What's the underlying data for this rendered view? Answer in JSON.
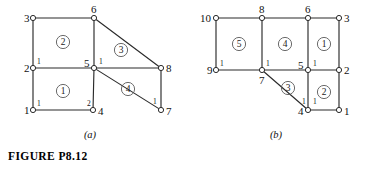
{
  "figure": {
    "caption": "FIGURE  P8.12",
    "sub_caption_a": "(a)",
    "sub_caption_b": "(b)"
  },
  "panel_a": {
    "name": "finite-element-mesh-a",
    "global_nodes": [
      {
        "id": "n1",
        "label": "1",
        "x": 33,
        "y": 110,
        "label_dx": -9,
        "label_dy": 4
      },
      {
        "id": "n2",
        "label": "2",
        "x": 33,
        "y": 68,
        "label_dx": -9,
        "label_dy": 4
      },
      {
        "id": "n3",
        "label": "3",
        "x": 33,
        "y": 18,
        "label_dx": -9,
        "label_dy": 4
      },
      {
        "id": "n4",
        "label": "4",
        "x": 93,
        "y": 110,
        "label_dx": 5,
        "label_dy": 5
      },
      {
        "id": "n5",
        "label": "5",
        "x": 94,
        "y": 68,
        "label_dx": -10,
        "label_dy": -1
      },
      {
        "id": "n6",
        "label": "6",
        "x": 94,
        "y": 18,
        "label_dx": -3,
        "label_dy": -5
      },
      {
        "id": "n7",
        "label": "7",
        "x": 161,
        "y": 110,
        "label_dx": 5,
        "label_dy": 5
      },
      {
        "id": "n8",
        "label": "8",
        "x": 161,
        "y": 68,
        "label_dx": 5,
        "label_dy": 4
      }
    ],
    "edges": [
      {
        "from": "n1",
        "to": "n2"
      },
      {
        "from": "n2",
        "to": "n3"
      },
      {
        "from": "n3",
        "to": "n6"
      },
      {
        "from": "n6",
        "to": "n5"
      },
      {
        "from": "n5",
        "to": "n2"
      },
      {
        "from": "n1",
        "to": "n4"
      },
      {
        "from": "n4",
        "to": "n5"
      },
      {
        "from": "n5",
        "to": "n8"
      },
      {
        "from": "n6",
        "to": "n8"
      },
      {
        "from": "n5",
        "to": "n7"
      },
      {
        "from": "n7",
        "to": "n8"
      }
    ],
    "elements": [
      {
        "label": "1",
        "x": 63,
        "y": 91
      },
      {
        "label": "2",
        "x": 63,
        "y": 42
      },
      {
        "label": "3",
        "x": 121,
        "y": 50
      },
      {
        "label": "4",
        "x": 128,
        "y": 89
      }
    ],
    "local_node_labels": [
      {
        "label": "1",
        "x": 37,
        "y": 106
      },
      {
        "label": "1",
        "x": 37,
        "y": 64
      },
      {
        "label": "1",
        "x": 99,
        "y": 64
      },
      {
        "label": "2",
        "x": 87,
        "y": 106
      },
      {
        "label": "1",
        "x": 153,
        "y": 104
      }
    ]
  },
  "panel_b": {
    "name": "finite-element-mesh-b",
    "global_nodes": [
      {
        "id": "m10",
        "label": "10",
        "x": 216,
        "y": 18,
        "label_dx": -16,
        "label_dy": 4
      },
      {
        "id": "m8",
        "label": "8",
        "x": 262,
        "y": 18,
        "label_dx": -3,
        "label_dy": -5
      },
      {
        "id": "m6",
        "label": "6",
        "x": 308,
        "y": 18,
        "label_dx": -3,
        "label_dy": -5
      },
      {
        "id": "m3",
        "label": "3",
        "x": 339,
        "y": 18,
        "label_dx": 5,
        "label_dy": 4
      },
      {
        "id": "m9",
        "label": "9",
        "x": 216,
        "y": 70,
        "label_dx": -9,
        "label_dy": 4
      },
      {
        "id": "m7",
        "label": "7",
        "x": 262,
        "y": 70,
        "label_dx": -3,
        "label_dy": 14
      },
      {
        "id": "m5",
        "label": "5",
        "x": 308,
        "y": 70,
        "label_dx": -10,
        "label_dy": -1
      },
      {
        "id": "m2",
        "label": "2",
        "x": 339,
        "y": 70,
        "label_dx": 5,
        "label_dy": 4
      },
      {
        "id": "m4",
        "label": "4",
        "x": 308,
        "y": 110,
        "label_dx": -10,
        "label_dy": 5
      },
      {
        "id": "m1",
        "label": "1",
        "x": 339,
        "y": 110,
        "label_dx": 5,
        "label_dy": 5
      }
    ],
    "edges": [
      {
        "from": "m10",
        "to": "m8"
      },
      {
        "from": "m8",
        "to": "m6"
      },
      {
        "from": "m6",
        "to": "m3"
      },
      {
        "from": "m10",
        "to": "m9"
      },
      {
        "from": "m8",
        "to": "m7"
      },
      {
        "from": "m6",
        "to": "m5"
      },
      {
        "from": "m3",
        "to": "m2"
      },
      {
        "from": "m9",
        "to": "m7"
      },
      {
        "from": "m7",
        "to": "m5"
      },
      {
        "from": "m5",
        "to": "m2"
      },
      {
        "from": "m5",
        "to": "m4"
      },
      {
        "from": "m2",
        "to": "m1"
      },
      {
        "from": "m4",
        "to": "m1"
      },
      {
        "from": "m7",
        "to": "m4"
      }
    ],
    "elements": [
      {
        "label": "5",
        "x": 239,
        "y": 44
      },
      {
        "label": "4",
        "x": 285,
        "y": 44
      },
      {
        "label": "1",
        "x": 324,
        "y": 44
      },
      {
        "label": "3",
        "x": 288,
        "y": 88
      },
      {
        "label": "2",
        "x": 324,
        "y": 92
      }
    ],
    "local_node_labels": [
      {
        "label": "1",
        "x": 220,
        "y": 66
      },
      {
        "label": "1",
        "x": 266,
        "y": 66
      },
      {
        "label": "1",
        "x": 313,
        "y": 66
      },
      {
        "label": "1",
        "x": 302,
        "y": 104
      },
      {
        "label": "1",
        "x": 313,
        "y": 104
      }
    ]
  }
}
